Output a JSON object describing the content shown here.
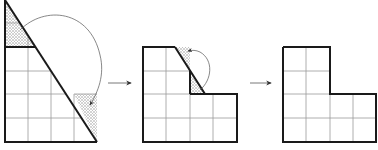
{
  "diagram": {
    "steps": [
      {
        "name": "right-triangle",
        "grid_cols": 4,
        "grid_rows": 6,
        "shaded_pieces": [
          "top-left-triangle",
          "bottom-right-square"
        ],
        "has_rotation_arrow": true
      },
      {
        "name": "intermediate-shape",
        "grid_cols": 4,
        "grid_rows": 4,
        "shaded_pieces": [
          "small-triangle"
        ],
        "has_rotation_arrow": true
      },
      {
        "name": "l-shape",
        "grid_cols": 4,
        "grid_rows": 4,
        "shaded_pieces": [],
        "has_rotation_arrow": false
      }
    ],
    "transitions": 2,
    "colors": {
      "outline": "#1a1a1a",
      "grid": "#9a9a9a",
      "shade": "#cfcfcf",
      "arrow": "#555555"
    }
  }
}
